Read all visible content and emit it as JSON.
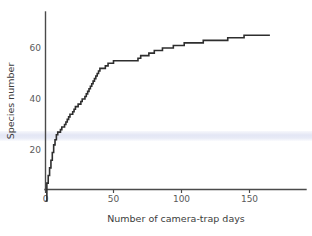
{
  "chart_data": {
    "type": "line",
    "title": "",
    "xlabel": "Number of camera-trap days",
    "ylabel": "Species number",
    "xlim": [
      0,
      180
    ],
    "ylim": [
      0,
      72
    ],
    "xticks": [
      0,
      50,
      100,
      150
    ],
    "yticks": [
      20,
      40,
      60
    ],
    "xticklabels": [
      "0",
      "50",
      "100",
      "150"
    ],
    "yticklabels": [
      "20",
      "40",
      "60"
    ],
    "grid": false,
    "legend": null,
    "series": [
      {
        "name": "Cumulative species richness",
        "style": "step",
        "color": "#2e2e2e",
        "x": [
          0,
          1,
          2,
          3,
          4,
          5,
          6,
          7,
          8,
          9,
          10,
          11,
          12,
          13,
          14,
          15,
          16,
          17,
          18,
          19,
          20,
          21,
          22,
          23,
          24,
          25,
          26,
          27,
          28,
          29,
          30,
          31,
          32,
          33,
          34,
          35,
          36,
          37,
          38,
          39,
          40,
          42,
          44,
          46,
          48,
          50,
          53,
          56,
          60,
          64,
          68,
          70,
          72,
          74,
          76,
          78,
          80,
          83,
          86,
          90,
          94,
          98,
          102,
          106,
          110,
          116,
          122,
          128,
          134,
          140,
          146,
          152,
          158,
          165
        ],
        "y": [
          0,
          7,
          10,
          13,
          16,
          19,
          22,
          24,
          26,
          27,
          27,
          28,
          29,
          29,
          30,
          31,
          32,
          33,
          34,
          34,
          35,
          36,
          37,
          37,
          38,
          38,
          39,
          40,
          40,
          41,
          42,
          43,
          44,
          45,
          46,
          47,
          48,
          49,
          50,
          51,
          52,
          52,
          53,
          54,
          54,
          55,
          55,
          55,
          55,
          55,
          56,
          57,
          57,
          57,
          58,
          58,
          59,
          59,
          60,
          60,
          61,
          61,
          62,
          62,
          62,
          63,
          63,
          63,
          64,
          64,
          65,
          65,
          65,
          65
        ]
      }
    ],
    "annotations": []
  },
  "axes": {
    "y_label": "Species number",
    "x_label": "Number of camera-trap days",
    "y_tick_0": "20",
    "y_tick_1": "40",
    "y_tick_2": "60",
    "x_tick_0": "0",
    "x_tick_1": "50",
    "x_tick_2": "100",
    "x_tick_3": "150"
  },
  "colors": {
    "curve": "#2e2e2e",
    "axis": "#4a4a4a",
    "tick_text": "#5a5a5a",
    "label_text": "#3c3c3c",
    "highlight_band": "#e2e5f4",
    "background": "#ffffff"
  }
}
